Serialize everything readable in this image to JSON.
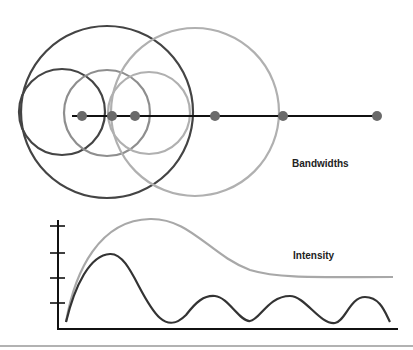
{
  "diagram": {
    "bandwidths_label": "Bandwidths",
    "intensity_label": "Intensity",
    "colors": {
      "dark": "#444444",
      "mid": "#8e8e8e",
      "light": "#b0b0b0",
      "dot": "#6a6a6a",
      "axis": "#111111",
      "rule": "#999999"
    },
    "circles": [
      {
        "cx": 107,
        "cy": 112,
        "r": 86,
        "color": "dark"
      },
      {
        "cx": 62,
        "cy": 112,
        "r": 43,
        "color": "dark"
      },
      {
        "cx": 107,
        "cy": 113,
        "r": 43,
        "color": "mid"
      },
      {
        "cx": 149,
        "cy": 113,
        "r": 41,
        "color": "light"
      },
      {
        "cx": 195,
        "cy": 112,
        "r": 84,
        "color": "light"
      }
    ],
    "dots_x": [
      82,
      112,
      135,
      215,
      283,
      377
    ],
    "line_y": 116
  }
}
